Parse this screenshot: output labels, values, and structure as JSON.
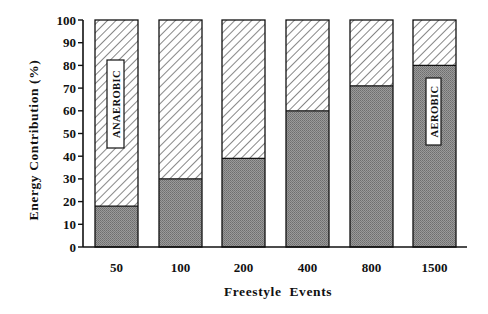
{
  "chart_data": {
    "type": "bar",
    "stacked": true,
    "title": "",
    "xlabel": "Freestyle  Events",
    "ylabel": "Energy  Contribution  (%)",
    "ylim": [
      0,
      100
    ],
    "yticks": [
      0,
      10,
      20,
      30,
      40,
      50,
      60,
      70,
      80,
      90,
      100
    ],
    "grid": false,
    "categories": [
      "50",
      "100",
      "200",
      "400",
      "800",
      "1500"
    ],
    "series": [
      {
        "name": "AEROBIC",
        "fill": "stippled-gray",
        "color": "#8c8c8c",
        "values": [
          18,
          30,
          39,
          60,
          71,
          80
        ]
      },
      {
        "name": "ANAEROBIC",
        "fill": "diagonal-hatch",
        "color": "#ffffff",
        "values": [
          82,
          70,
          61,
          40,
          29,
          20
        ]
      }
    ],
    "annotations": [
      {
        "text": "ANAEROBIC",
        "bar": "50",
        "orientation": "vertical",
        "boxed": true
      },
      {
        "text": "AEROBIC",
        "bar": "1500",
        "orientation": "vertical",
        "boxed": true
      }
    ],
    "legend": "none (in-bar boxed labels)"
  },
  "labels": {
    "xlabel": "Freestyle  Events",
    "ylabel": "Energy  Contribution  (%)",
    "anaerobic": "ANAEROBIC",
    "aerobic": "AEROBIC"
  }
}
